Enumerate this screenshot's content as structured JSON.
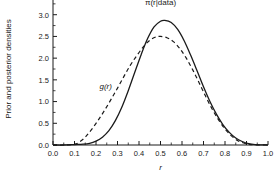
{
  "chart_data": {
    "type": "line",
    "title": "",
    "xlabel": "r",
    "ylabel": "Prior and posterior densities",
    "xlim": [
      0.0,
      1.0
    ],
    "ylim": [
      0.0,
      3.5
    ],
    "grid": false,
    "legend_position": "inline-annotations",
    "x_ticks": [
      "0.0",
      "0.1",
      "0.2",
      "0.3",
      "0.4",
      "0.5",
      "0.6",
      "0.7",
      "0.8",
      "0.9",
      "1.0"
    ],
    "x_tick_values": [
      0.0,
      0.1,
      0.2,
      0.3,
      0.4,
      0.5,
      0.6,
      0.7,
      0.8,
      0.9,
      1.0
    ],
    "y_ticks": [
      "0.0",
      "0.5",
      "1.0",
      "1.5",
      "2.0",
      "2.5",
      "3.0",
      "3.5"
    ],
    "y_tick_values": [
      0.0,
      0.5,
      1.0,
      1.5,
      2.0,
      2.5,
      3.0,
      3.5
    ],
    "minor_ticks_per_interval": 1,
    "series": [
      {
        "name": "posterior",
        "label": "π(r|data)",
        "style": "solid",
        "color": "#1a1a1a",
        "peak_x": 0.52,
        "peak_y": 2.87,
        "x": [
          0.0,
          0.05,
          0.1,
          0.14,
          0.17,
          0.2,
          0.23,
          0.26,
          0.29,
          0.32,
          0.35,
          0.38,
          0.41,
          0.44,
          0.47,
          0.5,
          0.52,
          0.55,
          0.58,
          0.61,
          0.64,
          0.67,
          0.7,
          0.73,
          0.76,
          0.79,
          0.82,
          0.85,
          0.88,
          0.91,
          0.94,
          1.0
        ],
        "y": [
          0.0,
          0.0,
          0.01,
          0.02,
          0.04,
          0.09,
          0.18,
          0.33,
          0.56,
          0.87,
          1.25,
          1.67,
          2.08,
          2.45,
          2.72,
          2.85,
          2.87,
          2.82,
          2.66,
          2.4,
          2.07,
          1.71,
          1.34,
          1.0,
          0.71,
          0.47,
          0.29,
          0.16,
          0.08,
          0.03,
          0.01,
          0.0
        ]
      },
      {
        "name": "prior",
        "label": "g(r)",
        "style": "dashed",
        "color": "#1a1a1a",
        "peak_x": 0.5,
        "peak_y": 2.5,
        "x": [
          0.0,
          0.05,
          0.1,
          0.12,
          0.15,
          0.18,
          0.21,
          0.24,
          0.27,
          0.3,
          0.33,
          0.36,
          0.39,
          0.42,
          0.45,
          0.48,
          0.5,
          0.53,
          0.56,
          0.59,
          0.62,
          0.65,
          0.68,
          0.71,
          0.74,
          0.77,
          0.8,
          0.83,
          0.86,
          0.89,
          0.92,
          1.0
        ],
        "y": [
          0.0,
          0.0,
          0.02,
          0.06,
          0.18,
          0.36,
          0.57,
          0.8,
          1.05,
          1.31,
          1.58,
          1.84,
          2.06,
          2.26,
          2.41,
          2.49,
          2.5,
          2.47,
          2.38,
          2.22,
          2.0,
          1.73,
          1.43,
          1.12,
          0.83,
          0.58,
          0.37,
          0.21,
          0.1,
          0.04,
          0.01,
          0.0
        ]
      }
    ],
    "annotations": [
      {
        "name": "posterior-label",
        "text": "π(r|data)",
        "x": 0.5,
        "y": 3.22
      },
      {
        "name": "prior-label",
        "text": "g(r)",
        "x": 0.245,
        "y": 1.3
      }
    ]
  }
}
